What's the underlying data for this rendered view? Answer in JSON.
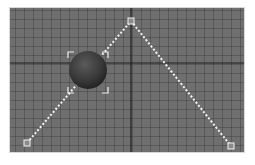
{
  "viewport": {
    "background": "#6f6f6f",
    "grid_color": "#4a4a4a",
    "axis_color": "#1e1e1e",
    "axis_horizontal_y": 63,
    "axis_vertical_x": 131
  },
  "path": {
    "color": "#f2f2f2",
    "control_points": [
      {
        "x": 27,
        "y": 143
      },
      {
        "x": 131,
        "y": 21
      },
      {
        "x": 231,
        "y": 146
      }
    ]
  },
  "sphere": {
    "cx": 88,
    "cy": 70,
    "r": 19,
    "color": "#3c3c3c",
    "selected": true,
    "bracket_color": "#eeeeee"
  }
}
